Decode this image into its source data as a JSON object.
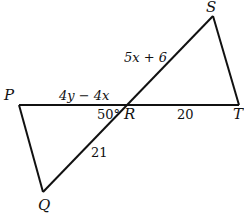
{
  "figure": {
    "points": {
      "P": "P",
      "Q": "Q",
      "R": "R",
      "S": "S",
      "T": "T"
    },
    "labels": {
      "RS": "5x + 6",
      "PR": "4y − 4x",
      "RT": "20",
      "QR": "21",
      "angle_PRQ": "50°"
    },
    "stroke_color": "#111111"
  }
}
